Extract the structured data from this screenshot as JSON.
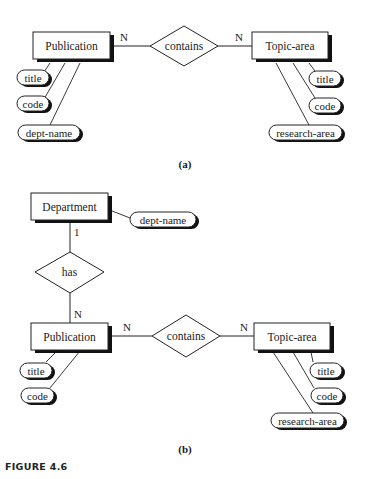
{
  "diagram_a": {
    "caption": "(a)",
    "entities": {
      "publication": "Publication",
      "topic_area": "Topic-area"
    },
    "relationship": "contains",
    "cardinalities": {
      "left": "N",
      "right": "N"
    },
    "publication_attributes": [
      "title",
      "code",
      "dept-name"
    ],
    "topic_attributes": [
      "title",
      "code",
      "research-area"
    ]
  },
  "diagram_b": {
    "caption": "(b)",
    "entities": {
      "department": "Department",
      "publication": "Publication",
      "topic_area": "Topic-area"
    },
    "department_attribute": "dept-name",
    "relationship_has": "has",
    "has_cardinalities": {
      "top": "1",
      "bottom": "N"
    },
    "relationship_contains": "contains",
    "contains_cardinalities": {
      "left": "N",
      "right": "N"
    },
    "publication_attributes": [
      "title",
      "code"
    ],
    "topic_attributes": [
      "title",
      "code",
      "research-area"
    ]
  },
  "figure_label": "FIGURE 4.6"
}
